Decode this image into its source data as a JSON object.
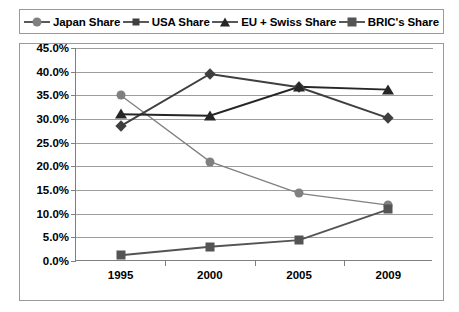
{
  "legend": {
    "items": [
      {
        "label": "Japan Share",
        "marker": "circle-marker",
        "color": "#808080"
      },
      {
        "label": "USA Share",
        "marker": "diamond-marker",
        "color": "#3f3f3f"
      },
      {
        "label": "EU + Swiss Share",
        "marker": "triangle-marker",
        "color": "#262626"
      },
      {
        "label": "BRIC's Share",
        "marker": "square-marker",
        "color": "#545454"
      }
    ]
  },
  "axes": {
    "y_ticks": [
      "0.0%",
      "5.0%",
      "10.0%",
      "15.0%",
      "20.0%",
      "25.0%",
      "30.0%",
      "35.0%",
      "40.0%",
      "45.0%"
    ],
    "x_ticks": [
      "1995",
      "2000",
      "2005",
      "2009"
    ]
  },
  "chart_data": {
    "type": "line",
    "title": "",
    "subtitle": "",
    "xlabel": "",
    "ylabel": "",
    "categories": [
      "1995",
      "2000",
      "2005",
      "2009"
    ],
    "ylim": [
      0,
      45
    ],
    "ytick_values": [
      0,
      5,
      10,
      15,
      20,
      25,
      30,
      35,
      40,
      45
    ],
    "ytick_labels": [
      "0.0%",
      "5.0%",
      "10.0%",
      "15.0%",
      "20.0%",
      "25.0%",
      "30.0%",
      "35.0%",
      "40.0%",
      "45.0%"
    ],
    "y_unit": "%",
    "grid": "horizontal",
    "legend_position": "top",
    "series": [
      {
        "name": "Japan Share",
        "marker": "circle",
        "color": "#808080",
        "values": [
          35.0,
          21.0,
          14.3,
          11.8
        ]
      },
      {
        "name": "USA Share",
        "marker": "diamond",
        "color": "#3f3f3f",
        "values": [
          28.5,
          39.5,
          36.7,
          30.2
        ]
      },
      {
        "name": "EU + Swiss Share",
        "marker": "triangle",
        "color": "#262626",
        "values": [
          31.0,
          30.7,
          36.8,
          36.2
        ]
      },
      {
        "name": "BRIC's Share",
        "marker": "square",
        "color": "#545454",
        "values": [
          1.2,
          3.0,
          4.4,
          10.9
        ]
      }
    ]
  }
}
